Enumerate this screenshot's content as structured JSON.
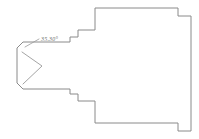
{
  "drawing": {
    "title": "Stepped profile section with chamfered end",
    "type": "engineering-line-drawing",
    "canvas": {
      "width": 199,
      "height": 139,
      "background": "#ffffff"
    },
    "style": {
      "outline_color": "#8a8a8a",
      "detail_color": "#9a9a9a",
      "leader_color": "#9a9a9a",
      "label_color": "#6f6f6f",
      "stroke_width": 1
    },
    "annotations": [
      {
        "name": "chamfer-angle",
        "text": "35.30°",
        "x": 41,
        "y": 41,
        "leader_from": [
          39,
          39
        ],
        "leader_to": [
          25,
          47
        ]
      }
    ],
    "geometry": {
      "outline_points": "17,48 23,42 70,42 70,37 78,37 78,30 95,30 95,8 178,8 178,16 191,16 191,21 178,21 178,13 95,13 95,35 78,35 78,42 70,42 70,48 23,48",
      "outline_path": "M 23,42 L 70,42 L 70,37 L 78,37 L 78,30 L 95,30 L 95,8 L 178,8 L 178,16 L 191,16 L 191,131 L 178,131 L 178,123 L 95,123 L 95,101 L 78,101 L 78,94 L 70,94 L 70,89 L 23,89 L 17,83 L 17,48 Z",
      "notch_path": "M 22,52 L 42,66 L 23,84"
    }
  }
}
